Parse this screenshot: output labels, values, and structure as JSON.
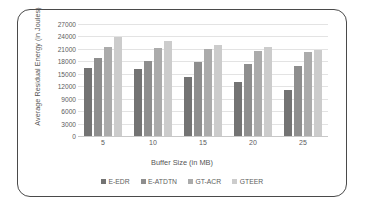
{
  "chart_data": {
    "type": "bar",
    "title": "",
    "xlabel": "Buffer Size (in MB)",
    "ylabel": "Average Residual Energy (in Joules)",
    "categories": [
      "5",
      "10",
      "15",
      "20",
      "25"
    ],
    "ylim": [
      0,
      27000
    ],
    "yticks": [
      0,
      3000,
      6000,
      9000,
      12000,
      15000,
      18000,
      21000,
      24000,
      27000
    ],
    "ytick_labels": [
      "0",
      "3000",
      "6000",
      "9000",
      "12000",
      "15000",
      "18000",
      "21000",
      "24000",
      "27000"
    ],
    "grid": true,
    "legend_position": "bottom",
    "series": [
      {
        "name": "E-EDR",
        "color": "#737373",
        "values": [
          16500,
          16200,
          14300,
          13100,
          11000
        ]
      },
      {
        "name": "E-ATDTN",
        "color": "#8e8e8e",
        "values": [
          18700,
          18200,
          17800,
          17300,
          16800
        ]
      },
      {
        "name": "GT-ACR",
        "color": "#ababab",
        "values": [
          21500,
          21200,
          20900,
          20400,
          20200
        ]
      },
      {
        "name": "GTEER",
        "color": "#cccccc",
        "values": [
          23800,
          23000,
          21900,
          21400,
          20700
        ]
      }
    ]
  }
}
